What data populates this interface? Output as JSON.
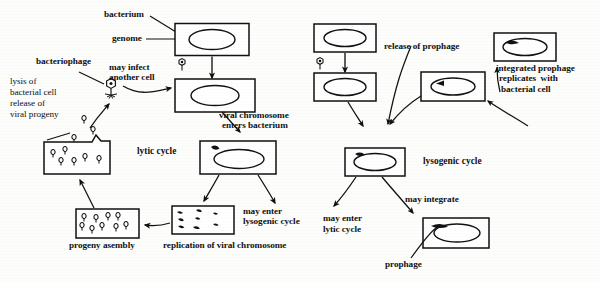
{
  "figure": {
    "ink_color": "#111111",
    "background_color": "#fdfdfc"
  },
  "cycles": {
    "lytic": "lytic cycle",
    "lysogenic": "lysogenic cycle"
  },
  "labels": {
    "bacterium": "bacterium",
    "genome": "genome",
    "bacteriophage": "bacteriophage",
    "may_infect_another_cell_l1": "may infect",
    "may_infect_another_cell_l2": "another cell",
    "lysis_l1": "lysis of",
    "lysis_l2": "bacterial cell",
    "lysis_l3": "release of",
    "lysis_l4": "viral progeny",
    "viral_chromosome_l1": "viral chromosome",
    "viral_chromosome_l2": "enters bacterium",
    "progeny_assembly": "progeny asembly",
    "replication": "replication of viral chromosome",
    "may_enter_lysogenic_l1": "may enter",
    "may_enter_lysogenic_l2": "lysogenic cycle",
    "release_of_prophage": "release of prophage",
    "integrated_l1": "integrated prophage",
    "integrated_l2": "replicates  with",
    "integrated_l3": "bacterial cell",
    "may_enter_lytic_l1": "may enter",
    "may_enter_lytic_l2": "lytic cycle",
    "may_integrate": "may integrate",
    "prophage": "prophage"
  },
  "icons": {
    "phage_free": "bacteriophage-icon",
    "phage_attached_left": "attached-phage-icon",
    "phage_attached_right": "attached-phage-icon",
    "bacterium_box": "bacterium-cell-icon",
    "genome_ellipse": "circular-genome-icon",
    "lysed_cell": "lysed-bacterium-icon",
    "dna_fragments": "replicated-dna-fragments-icon",
    "progeny_particles": "progeny-phage-particles-icon",
    "prophage_segment": "integrated-prophage-segment-icon",
    "arrow": "flow-arrow-icon",
    "leader_line": "leader-line-icon"
  },
  "structures": {
    "left_panel_name": "lytic-cycle-panel",
    "right_panel_name": "lysogenic-cycle-panel"
  }
}
